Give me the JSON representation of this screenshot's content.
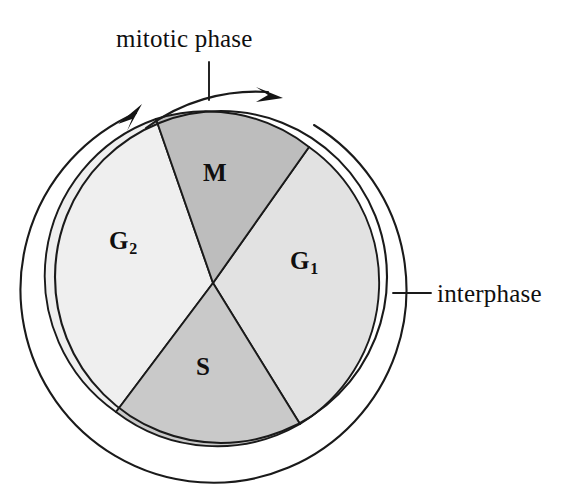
{
  "figure": {
    "background_color": "#ffffff",
    "line_color": "#1a1a1a",
    "text_color": "#100f0f"
  },
  "callouts": [
    {
      "id": "mitotic-phase",
      "label": "mitotic phase",
      "leader": "vertical line from label down to mitotic arc"
    },
    {
      "id": "interphase",
      "label": "interphase",
      "leader": "horizontal line from outer ring arc to label"
    }
  ],
  "callout_labels": {
    "mitotic_phase": "mitotic phase",
    "interphase": "interphase"
  },
  "sectors": [
    {
      "id": "m",
      "label": "M",
      "subscript": "",
      "fill": "#bdbdbd",
      "start_deg": -115,
      "end_deg": -58
    },
    {
      "id": "g1",
      "label": "G",
      "subscript": "1",
      "fill": "#e2e2e2",
      "start_deg": -58,
      "end_deg": 62
    },
    {
      "id": "s",
      "label": "S",
      "subscript": "",
      "fill": "#c9c9c9",
      "start_deg": 62,
      "end_deg": 160
    },
    {
      "id": "g2",
      "label": "G",
      "subscript": "2",
      "fill": "#efefef",
      "start_deg": 160,
      "end_deg": 245
    }
  ],
  "sector_labels": {
    "m": "M",
    "g1": "G",
    "g1_sub": "1",
    "s": "S",
    "g2": "G",
    "g2_sub": "2"
  },
  "arrows": {
    "interphase_ring": "clockwise arrowhead on outer ring at upper left",
    "mitotic_arc": "clockwise arrowhead at right end of mitotic arc"
  },
  "colors": {
    "m_fill": "#bdbdbd",
    "g1_fill": "#e2e2e2",
    "s_fill": "#c9c9c9",
    "g2_fill": "#efefef",
    "stroke": "#1a1a1a"
  }
}
